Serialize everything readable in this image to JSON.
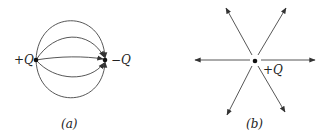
{
  "figure_a": {
    "caption": "(a)",
    "positive_charge_label": "+Q",
    "negative_charge_label": "−Q",
    "description": "Field lines between equal and opposite charges"
  },
  "figure_b": {
    "caption": "(b)",
    "charge_label": "+Q",
    "description": "Radial field lines from an isolated positive charge",
    "line_count": 6
  },
  "colors": {
    "line": "#333333",
    "background": "#ffffff"
  }
}
